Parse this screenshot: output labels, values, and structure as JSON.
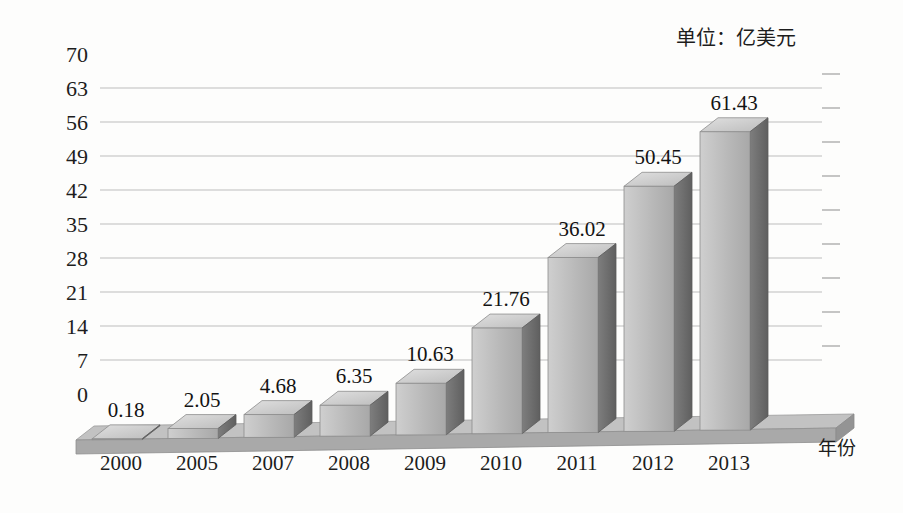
{
  "chart_data": {
    "type": "bar",
    "title": "",
    "subtitle": "",
    "unit_note": "单位：亿美元",
    "xlabel": "年份",
    "ylabel": "",
    "categories": [
      "2000",
      "2005",
      "2007",
      "2008",
      "2009",
      "2010",
      "2011",
      "2012",
      "2013"
    ],
    "values": [
      0.18,
      2.05,
      4.68,
      6.35,
      10.63,
      21.76,
      36.02,
      50.45,
      61.43
    ],
    "value_labels": [
      "0.18",
      "2.05",
      "4.68",
      "6.35",
      "10.63",
      "21.76",
      "36.02",
      "50.45",
      "61.43"
    ],
    "ylim": [
      0,
      70
    ],
    "ytick_values": [
      0,
      7,
      14,
      21,
      28,
      35,
      42,
      49,
      56,
      63,
      70
    ],
    "ytick_labels": [
      "0",
      "7",
      "14",
      "21",
      "28",
      "35",
      "42",
      "49",
      "56",
      "63",
      "70"
    ],
    "grid": true,
    "grid_axis": "y",
    "legend": false,
    "legend_position": "none",
    "style": "3d-column",
    "series": [
      {
        "name": "",
        "values": [
          0.18,
          2.05,
          4.68,
          6.35,
          10.63,
          21.76,
          36.02,
          50.45,
          61.43
        ]
      }
    ]
  },
  "colors": {
    "background": "#fdfdfc",
    "bar_front": "#b9b9b9",
    "bar_front_light": "#cfcfcf",
    "bar_side": "#6e6e6e",
    "bar_top": "#d6d6d6",
    "floor_top": "#c2c2c2",
    "floor_front": "#a9a9a9",
    "gridline": "#bdbdbd",
    "text": "#1d1d1d"
  },
  "axis": {
    "unit_note": "单位：亿美元",
    "x_axis_title": "年份"
  }
}
